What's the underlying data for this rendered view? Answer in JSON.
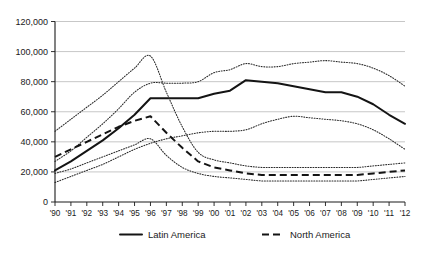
{
  "chart_data": {
    "type": "line",
    "title": "",
    "subtitle": "",
    "xlabel": "",
    "ylabel": "",
    "grid": true,
    "legend_position": "bottom",
    "xlim": [
      1990,
      2012
    ],
    "ylim": [
      0,
      120000
    ],
    "ytick_values": [
      0,
      20000,
      40000,
      60000,
      80000,
      100000,
      120000
    ],
    "ytick_labels": [
      "0",
      "20,000",
      "40,000",
      "60,000",
      "80,000",
      "100,000",
      "120,000"
    ],
    "x": [
      1990,
      1991,
      1992,
      1993,
      1994,
      1995,
      1996,
      1997,
      1998,
      1999,
      2000,
      2001,
      2002,
      2003,
      2004,
      2005,
      2006,
      2007,
      2008,
      2009,
      2010,
      2011,
      2012
    ],
    "xtick_labels": [
      "'90",
      "'91",
      "'92",
      "'93",
      "'94",
      "'95",
      "'96",
      "'97",
      "'98",
      "'99",
      "'00",
      "'01",
      "'02",
      "'03",
      "'04",
      "'05",
      "'06",
      "'07",
      "'08",
      "'09",
      "'10",
      "'11",
      "'12"
    ],
    "series": [
      {
        "name": "Latin America",
        "style": "solid",
        "values": [
          21000,
          27000,
          34000,
          41000,
          49000,
          58000,
          69000,
          69000,
          69000,
          69000,
          72000,
          74000,
          81000,
          80000,
          79000,
          77000,
          75000,
          73000,
          73000,
          70000,
          65000,
          58000,
          52000
        ]
      },
      {
        "name": "Latin America upper bound",
        "style": "dotted",
        "values": [
          27000,
          34000,
          43000,
          52000,
          62000,
          73000,
          79000,
          79000,
          79000,
          80000,
          86000,
          88000,
          92000,
          90000,
          90000,
          92000,
          93000,
          94000,
          93000,
          92000,
          89000,
          84000,
          77000
        ]
      },
      {
        "name": "Latin America lower bound",
        "style": "dotted",
        "values": [
          13000,
          17000,
          21000,
          25000,
          30000,
          35000,
          39000,
          42000,
          44000,
          46000,
          47000,
          47000,
          48000,
          52000,
          55000,
          57000,
          56000,
          55000,
          54000,
          52000,
          48000,
          42000,
          35000
        ]
      },
      {
        "name": "North America",
        "style": "dashed",
        "values": [
          30000,
          35000,
          40000,
          45000,
          50000,
          54000,
          57000,
          46000,
          36000,
          27000,
          23000,
          21000,
          19000,
          18000,
          18000,
          18000,
          18000,
          18000,
          18000,
          18000,
          19000,
          20000,
          21000
        ]
      },
      {
        "name": "North America upper bound",
        "style": "dotted",
        "values": [
          47000,
          55000,
          63000,
          71000,
          80000,
          89000,
          97000,
          73000,
          50000,
          33000,
          28000,
          26000,
          24000,
          23000,
          23000,
          23000,
          23000,
          23000,
          23000,
          23000,
          24000,
          25000,
          26000
        ]
      },
      {
        "name": "North America lower bound",
        "style": "dotted",
        "values": [
          19000,
          22000,
          26000,
          30000,
          34000,
          38000,
          42000,
          31000,
          23000,
          19000,
          17000,
          16000,
          15000,
          14000,
          14000,
          14000,
          14000,
          14000,
          14000,
          14000,
          15000,
          16000,
          17000
        ]
      }
    ],
    "legend": [
      {
        "label": "Latin America",
        "style": "solid"
      },
      {
        "label": "North America",
        "style": "dashed"
      }
    ]
  },
  "colors": {
    "line": "#141414",
    "grid": "#b9b9b9",
    "axis": "#1a1a1a",
    "background": "#ffffff"
  }
}
